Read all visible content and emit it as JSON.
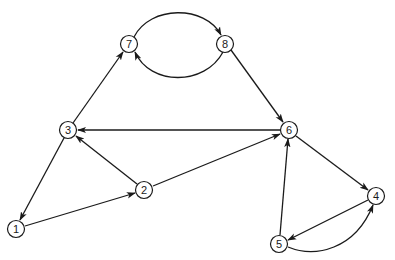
{
  "diagram": {
    "type": "directed-graph",
    "nodes": [
      {
        "id": "1",
        "label": "1",
        "x": 16,
        "y": 229
      },
      {
        "id": "2",
        "label": "2",
        "x": 144,
        "y": 190
      },
      {
        "id": "3",
        "label": "3",
        "x": 68,
        "y": 130
      },
      {
        "id": "4",
        "label": "4",
        "x": 376,
        "y": 196
      },
      {
        "id": "5",
        "label": "5",
        "x": 279,
        "y": 244
      },
      {
        "id": "6",
        "label": "6",
        "x": 289,
        "y": 130
      },
      {
        "id": "7",
        "label": "7",
        "x": 129,
        "y": 44
      },
      {
        "id": "8",
        "label": "8",
        "x": 225,
        "y": 44
      }
    ],
    "edges": [
      {
        "from": "3",
        "to": "7",
        "shape": "straight"
      },
      {
        "from": "7",
        "to": "8",
        "shape": "arc-upper"
      },
      {
        "from": "8",
        "to": "7",
        "shape": "arc-lower"
      },
      {
        "from": "8",
        "to": "6",
        "shape": "straight"
      },
      {
        "from": "6",
        "to": "3",
        "shape": "straight"
      },
      {
        "from": "3",
        "to": "1",
        "shape": "straight"
      },
      {
        "from": "1",
        "to": "2",
        "shape": "straight"
      },
      {
        "from": "2",
        "to": "3",
        "shape": "straight"
      },
      {
        "from": "2",
        "to": "6",
        "shape": "straight"
      },
      {
        "from": "6",
        "to": "4",
        "shape": "straight"
      },
      {
        "from": "4",
        "to": "5",
        "shape": "straight"
      },
      {
        "from": "5",
        "to": "4",
        "shape": "curve"
      },
      {
        "from": "5",
        "to": "6",
        "shape": "straight"
      }
    ],
    "colors": {
      "stroke": "#1a1a1a",
      "background": "#ffffff"
    }
  }
}
